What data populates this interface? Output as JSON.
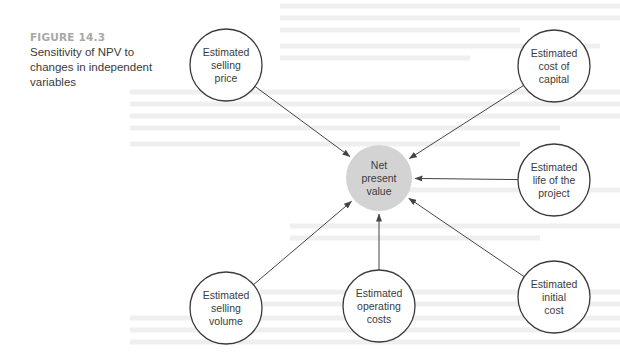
{
  "figure": {
    "label": "FIGURE 14.3",
    "title": "Sensitivity of NPV to changes in independent variables",
    "colors": {
      "label": "#a8a8a8",
      "center_fill": "#d3d3d3",
      "node_stroke": "#3a3a3a",
      "arrow": "#444444"
    }
  },
  "diagram": {
    "center": {
      "id": "npv",
      "label": "Net\npresent\nvalue",
      "cx": 379,
      "cy": 178,
      "r": 33
    },
    "nodes": [
      {
        "id": "selling-price",
        "label": "Estimated\nselling\nprice",
        "cx": 226,
        "cy": 65,
        "r": 36
      },
      {
        "id": "cost-of-capital",
        "label": "Estimated\ncost of\ncapital",
        "cx": 554,
        "cy": 66,
        "r": 36
      },
      {
        "id": "life-of-project",
        "label": "Estimated\nlife of the\nproject",
        "cx": 554,
        "cy": 180,
        "r": 36
      },
      {
        "id": "selling-volume",
        "label": "Estimated\nselling\nvolume",
        "cx": 226,
        "cy": 308,
        "r": 36
      },
      {
        "id": "operating-costs",
        "label": "Estimated\noperating\ncosts",
        "cx": 379,
        "cy": 306,
        "r": 36
      },
      {
        "id": "initial-cost",
        "label": "Estimated\ninitial\ncost",
        "cx": 554,
        "cy": 297,
        "r": 36
      }
    ],
    "edges": [
      {
        "from": "selling-price",
        "to": "npv"
      },
      {
        "from": "cost-of-capital",
        "to": "npv"
      },
      {
        "from": "life-of-project",
        "to": "npv"
      },
      {
        "from": "selling-volume",
        "to": "npv"
      },
      {
        "from": "operating-costs",
        "to": "npv"
      },
      {
        "from": "initial-cost",
        "to": "npv"
      }
    ]
  }
}
